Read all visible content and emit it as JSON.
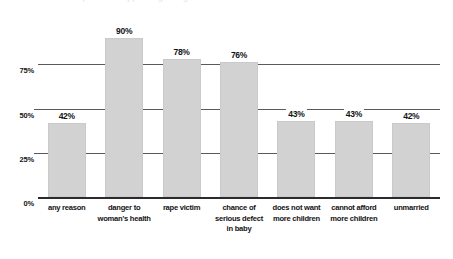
{
  "chart_data": {
    "type": "bar",
    "title": "",
    "xlabel": "",
    "ylabel": "",
    "ylim": [
      0,
      100
    ],
    "grid": true,
    "legend": false,
    "categories": [
      "any reason",
      "danger to woman's health",
      "rape victim",
      "chance of serious defect in baby",
      "does not want more children",
      "cannot afford more children",
      "unmarried"
    ],
    "category_lines": [
      [
        "any reason"
      ],
      [
        "danger to",
        "woman's health"
      ],
      [
        "rape victim"
      ],
      [
        "chance of",
        "serious defect",
        "in baby"
      ],
      [
        "does not want",
        "more children"
      ],
      [
        "cannot afford",
        "more children"
      ],
      [
        "unmarried"
      ]
    ],
    "values": [
      42,
      90,
      78,
      76,
      43,
      43,
      42
    ],
    "data_labels": [
      "42%",
      "90%",
      "78%",
      "76%",
      "43%",
      "43%",
      "42%"
    ],
    "ytick_values": [
      0,
      25,
      50,
      75
    ],
    "ytick_labels": [
      "0%",
      "25%",
      "50%",
      "75%"
    ]
  },
  "style": {
    "bar_fill": "#d2d2d2",
    "gridline_color": "#59595e",
    "axis_color": "#2b2b2e",
    "text_color": "#131315",
    "background": "#ffffff"
  },
  "header": {
    "cropped_title": "respondents approving of legal abortion if ..."
  }
}
